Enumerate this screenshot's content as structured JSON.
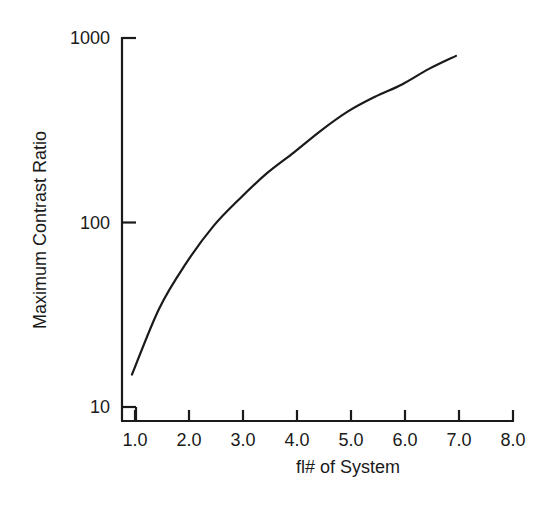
{
  "chart_data": {
    "type": "line",
    "title": "",
    "xlabel": "fl# of System",
    "ylabel": "Maximum Contrast Ratio",
    "yscale": "log",
    "xlim": [
      1.0,
      8.0
    ],
    "ylim": [
      10,
      1000
    ],
    "x_ticks": [
      "1.0",
      "2.0",
      "3.0",
      "4.0",
      "5.0",
      "6.0",
      "7.0",
      "8.0"
    ],
    "y_ticks": [
      "10",
      "100",
      "1000"
    ],
    "grid": false,
    "legend": null,
    "series": [
      {
        "name": "Maximum Contrast Ratio",
        "x": [
          1.0,
          1.5,
          2.0,
          2.5,
          3.0,
          3.5,
          4.0,
          4.5,
          5.0,
          5.5,
          6.0,
          6.5,
          7.0
        ],
        "y": [
          15,
          34,
          60,
          95,
          135,
          185,
          240,
          315,
          400,
          480,
          560,
          680,
          800
        ]
      }
    ],
    "colors": {
      "line": "#1a1a1a",
      "axis": "#1a1a1a",
      "background": "#ffffff"
    }
  }
}
